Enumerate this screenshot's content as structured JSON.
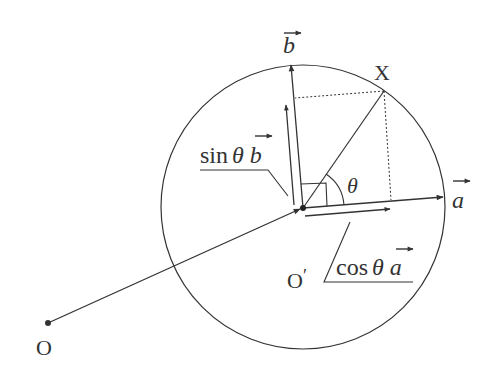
{
  "diagram": {
    "type": "vector-geometry",
    "colors": {
      "stroke": "#333333",
      "background": "#ffffff"
    },
    "labels": {
      "origin": "O",
      "center": "O",
      "center_prime": "′",
      "point": "X",
      "vector_a": "a",
      "vector_b": "b",
      "angle": "θ",
      "sin_label_func": "sin",
      "sin_label_theta": "θ",
      "sin_label_vec": "b",
      "cos_label_func": "cos",
      "cos_label_theta": "θ",
      "cos_label_vec": "a"
    },
    "points": {
      "O": [
        48,
        323
      ],
      "O_prime": [
        303,
        208
      ],
      "X": [
        384,
        91
      ],
      "a_tip": [
        443,
        197
      ],
      "b_tip": [
        291,
        65
      ]
    },
    "circle": {
      "cx": 303,
      "cy": 207,
      "r": 142
    }
  }
}
